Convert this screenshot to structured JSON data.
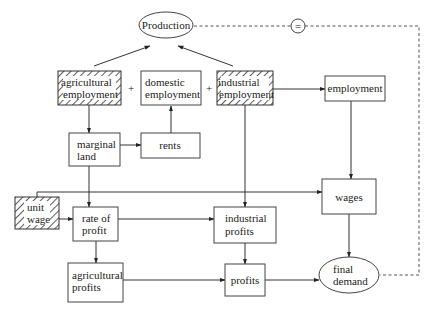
{
  "diagram": {
    "nodes": {
      "production": {
        "label": "Production",
        "shape": "ellipse"
      },
      "equals": {
        "label": "=",
        "shape": "circle"
      },
      "agricultural_employment": {
        "lines": [
          "agricultural",
          "employment"
        ],
        "shape": "hatched-box"
      },
      "domestic_employment": {
        "lines": [
          "domestic",
          "employment"
        ],
        "shape": "box"
      },
      "industrial_employment": {
        "lines": [
          "industrial",
          "employment"
        ],
        "shape": "hatched-box"
      },
      "employment": {
        "label": "employment",
        "shape": "box"
      },
      "marginal_land": {
        "lines": [
          "marginal",
          "land"
        ],
        "shape": "box"
      },
      "rents": {
        "label": "rents",
        "shape": "box"
      },
      "unit_wage": {
        "lines": [
          "unit",
          "wage"
        ],
        "shape": "hatched-box"
      },
      "rate_of_profit": {
        "lines": [
          "rate of",
          "profit"
        ],
        "shape": "box"
      },
      "industrial_profits": {
        "lines": [
          "industrial",
          "profits"
        ],
        "shape": "box"
      },
      "wages": {
        "label": "wages",
        "shape": "box"
      },
      "agricultural_profits": {
        "lines": [
          "agricultural",
          "profits"
        ],
        "shape": "box"
      },
      "profits": {
        "label": "profits",
        "shape": "box"
      },
      "final_demand": {
        "lines": [
          "final",
          "demand"
        ],
        "shape": "ellipse"
      }
    },
    "operators": {
      "plus1": "+",
      "plus2": "+"
    },
    "edges": [
      {
        "from": "agricultural_employment",
        "to": "production"
      },
      {
        "from": "industrial_employment",
        "to": "production"
      },
      {
        "from": "agricultural_employment",
        "to": "marginal_land"
      },
      {
        "from": "rents",
        "to": "domestic_employment"
      },
      {
        "from": "marginal_land",
        "to": "rents"
      },
      {
        "from": "industrial_employment",
        "to": "employment"
      },
      {
        "from": "employment",
        "to": "wages"
      },
      {
        "from": "marginal_land",
        "to": "rate_of_profit"
      },
      {
        "from": "unit_wage",
        "to": "rate_of_profit"
      },
      {
        "from": "unit_wage",
        "to": "wages"
      },
      {
        "from": "rate_of_profit",
        "to": "industrial_profits"
      },
      {
        "from": "industrial_employment",
        "to": "industrial_profits"
      },
      {
        "from": "rate_of_profit",
        "to": "agricultural_profits"
      },
      {
        "from": "industrial_profits",
        "to": "profits"
      },
      {
        "from": "agricultural_profits",
        "to": "profits"
      },
      {
        "from": "profits",
        "to": "final_demand"
      },
      {
        "from": "wages",
        "to": "final_demand"
      },
      {
        "from": "production",
        "to": "final_demand",
        "style": "dashed",
        "via": "equals"
      }
    ]
  }
}
